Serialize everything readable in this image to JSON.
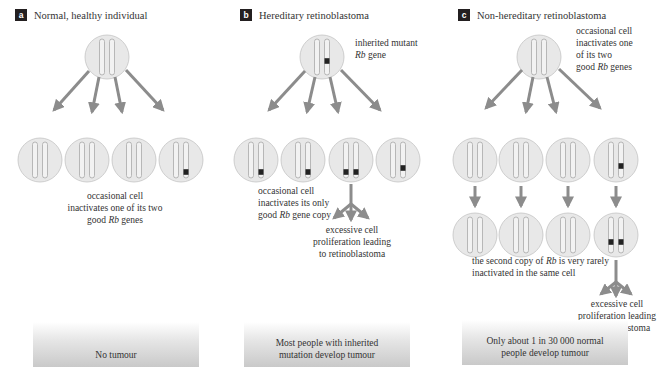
{
  "panels": [
    {
      "id": "a",
      "badge": "a",
      "title": "Normal, healthy individual",
      "annotations": {
        "row2_caption_line1": "occasional cell",
        "row2_caption_line2": "inactivates one of its two",
        "row2_caption_line3_pre": "good ",
        "row2_caption_line3_italic": "Rb",
        "row2_caption_line3_post": " genes"
      },
      "outcome": "No tumour"
    },
    {
      "id": "b",
      "badge": "b",
      "title": "Hereditary retinoblastoma",
      "annotations": {
        "top_line1": "inherited mutant",
        "top_line2_italic": "Rb",
        "top_line2_post": " gene",
        "row2_caption_line1": "occasional cell",
        "row2_caption_line2": "inactivates its only",
        "row2_caption_line3_pre": "good ",
        "row2_caption_line3_italic": "Rb",
        "row2_caption_line3_post": " gene copy",
        "prolif_line1": "excessive cell",
        "prolif_line2": "proliferation leading",
        "prolif_line3": "to retinoblastoma"
      },
      "outcome_line1": "Most people with inherited",
      "outcome_line2": "mutation develop tumour"
    },
    {
      "id": "c",
      "badge": "c",
      "title": "Non-hereditary retinoblastoma",
      "annotations": {
        "top_line1": "occasional cell",
        "top_line2": "inactivates one",
        "top_line3": "of its two",
        "top_line4_pre": "good ",
        "top_line4_italic": "Rb",
        "top_line4_post": " genes",
        "row3_caption_line1_pre": "the second copy of ",
        "row3_caption_line1_italic": "Rb",
        "row3_caption_line1_post": " is very rarely",
        "row3_caption_line2": "inactivated in the same cell",
        "prolif_line1": "excessive cell",
        "prolif_line2": "proliferation leading",
        "prolif_line3": "to retinoblastoma"
      },
      "outcome_line1": "Only about 1 in 30 000 normal",
      "outcome_line2": "people develop tumour"
    }
  ],
  "colors": {
    "cell_fill": "#e8e8e8",
    "cell_stroke": "#b5b5b5",
    "arrow": "#8c8c8c",
    "mutation": "#222222",
    "badge": "#231f20"
  }
}
